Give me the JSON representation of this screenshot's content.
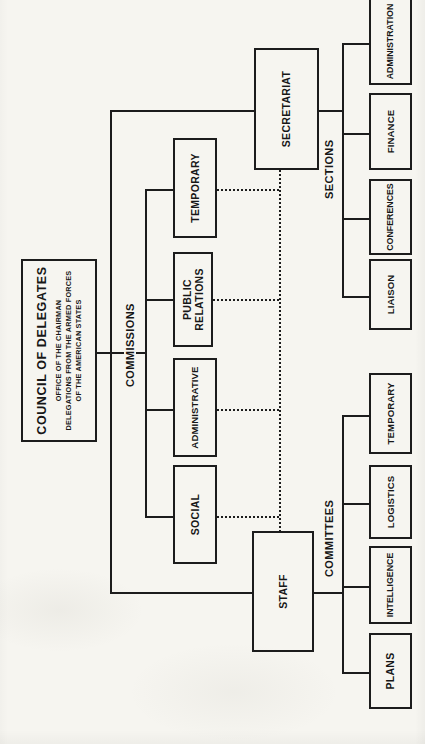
{
  "colors": {
    "paper": "#f6f5f0",
    "ink": "#1c1c1c"
  },
  "council": {
    "title": "COUNCIL OF DELEGATES",
    "line1": "OFFICE OF THE CHAIRMAN",
    "line2": "DELEGATIONS FROM THE ARMED FORCES",
    "line3": "OF THE AMERICAN STATES"
  },
  "staff": {
    "label": "STAFF"
  },
  "secretariat": {
    "label": "SECRETARIAT"
  },
  "groups": {
    "commissions": {
      "label": "COMMISSIONS",
      "items": [
        "SOCIAL",
        "ADMINISTRATIVE",
        "PUBLIC RELATIONS",
        "TEMPORARY"
      ]
    },
    "committees": {
      "label": "COMMITTEES",
      "items": [
        "PLANS",
        "INTELLIGENCE",
        "LOGISTICS",
        "TEMPORARY"
      ]
    },
    "sections": {
      "label": "SECTIONS",
      "items": [
        "LIAISON",
        "CONFERENCES",
        "FINANCE",
        "ADMINISTRATION"
      ]
    }
  }
}
